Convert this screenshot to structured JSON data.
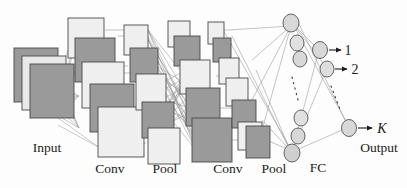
{
  "figure": {
    "background": "#fdfdfd"
  },
  "palette": {
    "dark_block_fill": "#9a9a9a",
    "light_block_fill": "#eeeeee",
    "block_stroke": "#4a4a4a",
    "node_fill": "#d8d8d8",
    "node_stroke": "#555555",
    "connection_stroke": "#8a8a8a",
    "text_color": "#1b1b1b"
  },
  "labels": {
    "input": "Input",
    "conv1": "Conv",
    "pool1": "Pool",
    "conv2": "Conv",
    "pool2": "Pool",
    "fc": "FC",
    "output": "Output"
  },
  "outputs": {
    "items": [
      {
        "label": "1"
      },
      {
        "label": "2"
      },
      {
        "label": "K"
      }
    ],
    "ellipsis": "vertical-dots"
  },
  "layers": [
    {
      "name": "input",
      "type": "stacked-feature-maps",
      "count": 3,
      "shade": "dark"
    },
    {
      "name": "conv1",
      "type": "feature-maps",
      "count": 4,
      "shade": "mixed"
    },
    {
      "name": "pool1",
      "type": "feature-maps",
      "count": 4,
      "shade": "mixed"
    },
    {
      "name": "conv2",
      "type": "feature-maps",
      "count": 5,
      "shade": "mixed"
    },
    {
      "name": "pool2",
      "type": "feature-maps",
      "count": 5,
      "shade": "mixed"
    },
    {
      "name": "fc",
      "type": "nodes",
      "count": 6,
      "shade": "node"
    },
    {
      "name": "output",
      "type": "nodes",
      "count": 3,
      "shade": "node"
    }
  ]
}
